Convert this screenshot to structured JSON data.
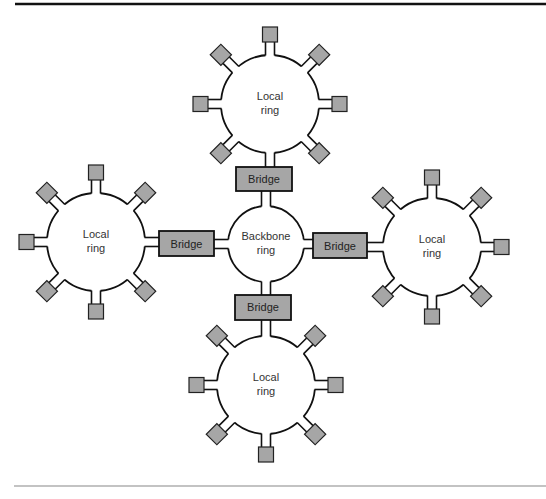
{
  "diagram": {
    "backbone": {
      "label_line1": "Backbone",
      "label_line2": "ring",
      "cx": 266,
      "cy": 244,
      "r": 38
    },
    "local_rings": [
      {
        "id": "top",
        "label_line1": "Local",
        "label_line2": "ring",
        "cx": 270,
        "cy": 104,
        "r": 49
      },
      {
        "id": "left",
        "label_line1": "Local",
        "label_line2": "ring",
        "cx": 96,
        "cy": 242,
        "r": 49
      },
      {
        "id": "right",
        "label_line1": "Local",
        "label_line2": "ring",
        "cx": 432,
        "cy": 247,
        "r": 49
      },
      {
        "id": "bottom",
        "label_line1": "Local",
        "label_line2": "ring",
        "cx": 266,
        "cy": 385,
        "r": 49
      }
    ],
    "bridges": [
      {
        "id": "top",
        "label": "Bridge",
        "x": 236,
        "y": 167,
        "w": 56,
        "h": 24
      },
      {
        "id": "left",
        "label": "Bridge",
        "x": 159,
        "y": 231,
        "w": 55,
        "h": 25
      },
      {
        "id": "right",
        "label": "Bridge",
        "x": 313,
        "y": 233,
        "w": 54,
        "h": 25
      },
      {
        "id": "bottom",
        "label": "Bridge",
        "x": 235,
        "y": 295,
        "w": 56,
        "h": 25
      }
    ],
    "colors": {
      "box_fill": "#a6a6a6",
      "stroke": "#111111",
      "rule_top": "#111111",
      "rule_bottom": "#888888"
    }
  }
}
